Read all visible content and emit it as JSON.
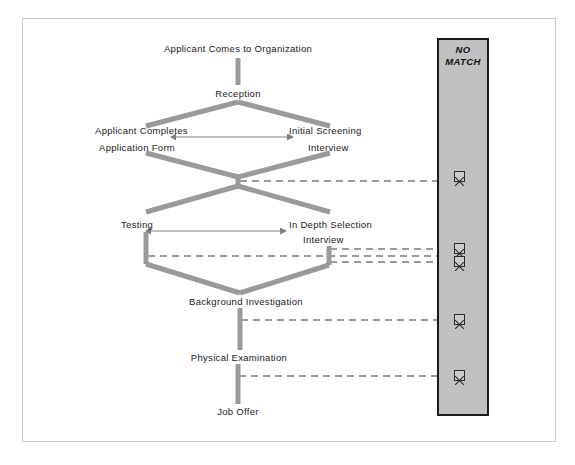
{
  "diagram": {
    "title_visible": false,
    "type": "flowchart",
    "orientation": "top-down",
    "colors": {
      "connector": "#9a9a9a",
      "node_text": "#1a1a1a",
      "panel_fill": "#c0c0c0",
      "panel_border": "#1a1a1a",
      "page_border": "#c9c9c9",
      "background": "#ffffff",
      "arrow_thin": "#7f7f7f"
    },
    "nodes": [
      {
        "id": "applicant_comes",
        "label": "Applicant Comes to Organization",
        "x": 238,
        "y": 50,
        "align": "center"
      },
      {
        "id": "reception",
        "label": "Reception",
        "x": 238,
        "y": 94,
        "align": "center"
      },
      {
        "id": "applicant_l1",
        "label": "Applicant Completes",
        "x": 95,
        "y": 131,
        "align": "left"
      },
      {
        "id": "applicant_l2",
        "label": "Application Form",
        "x": 99,
        "y": 148,
        "align": "left"
      },
      {
        "id": "screening_l1",
        "label": "Initial Screening",
        "x": 289,
        "y": 131,
        "align": "left"
      },
      {
        "id": "screening_l2",
        "label": "Interview",
        "x": 308,
        "y": 148,
        "align": "left"
      },
      {
        "id": "testing",
        "label": "Testing",
        "x": 124,
        "y": 225,
        "align": "left"
      },
      {
        "id": "indepth_l1",
        "label": "In Depth Selection",
        "x": 289,
        "y": 225,
        "align": "left"
      },
      {
        "id": "indepth_l2",
        "label": "Interview",
        "x": 303,
        "y": 240,
        "align": "left"
      },
      {
        "id": "background",
        "label": "Background Investigation",
        "x": 246,
        "y": 302,
        "align": "center"
      },
      {
        "id": "physical",
        "label": "Physical Examination",
        "x": 238,
        "y": 358,
        "align": "center"
      },
      {
        "id": "job_offer",
        "label": "Job Offer",
        "x": 238,
        "y": 412,
        "align": "center"
      }
    ],
    "bidirectional_arrows": [
      {
        "id": "arrow_application_screening",
        "from": "applicant_completes_application_form",
        "to": "initial_screening_interview",
        "x1": 172,
        "x2": 292,
        "y": 137
      },
      {
        "id": "arrow_testing_indepth",
        "from": "testing",
        "to": "in_depth_selection_interview",
        "x1": 147,
        "x2": 285,
        "y": 231
      }
    ],
    "reject_panel": {
      "title": "NO MATCH",
      "title_line1": "NO",
      "title_line2": "MATCH",
      "reject_markers": [
        {
          "id": "reject-1",
          "icon": "x-mark-icon",
          "x": 459,
          "y": 176,
          "source": "screening-converge"
        },
        {
          "id": "reject-2",
          "icon": "x-mark-icon",
          "x": 459,
          "y": 244,
          "source": "in-depth-interview-upper"
        },
        {
          "id": "reject-3",
          "icon": "x-mark-icon",
          "x": 459,
          "y": 257,
          "source": "testing-and-interview-lower"
        },
        {
          "id": "reject-4",
          "icon": "x-mark-icon",
          "x": 459,
          "y": 315,
          "source": "background-investigation"
        },
        {
          "id": "reject-5",
          "icon": "x-mark-icon",
          "x": 459,
          "y": 371,
          "source": "physical-examination"
        }
      ]
    },
    "reject_lines": [
      {
        "id": "reject-line-1",
        "x1": 240,
        "x2": 458,
        "y": 181
      },
      {
        "id": "reject-line-2",
        "x1": 329,
        "x2": 458,
        "y": 249
      },
      {
        "id": "reject-line-3",
        "x1": 147,
        "x2": 458,
        "y": 256
      },
      {
        "id": "reject-line-4",
        "x1": 329,
        "x2": 458,
        "y": 262
      },
      {
        "id": "reject-line-5",
        "x1": 240,
        "x2": 458,
        "y": 320
      },
      {
        "id": "reject-line-6",
        "x1": 240,
        "x2": 458,
        "y": 376
      }
    ]
  }
}
